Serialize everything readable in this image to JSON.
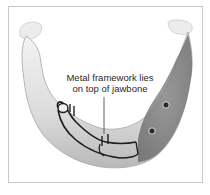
{
  "figure": {
    "label": {
      "line1": "Metal framework lies",
      "line2": "on top of jawbone"
    },
    "colors": {
      "border": "#c8c8c8",
      "bone_light": "#eeeeee",
      "bone_mid": "#cfcfcf",
      "bone_shadow": "#a8a8a8",
      "gum_dark": "#7a7a7a",
      "framework": "#1e1e1e"
    }
  }
}
